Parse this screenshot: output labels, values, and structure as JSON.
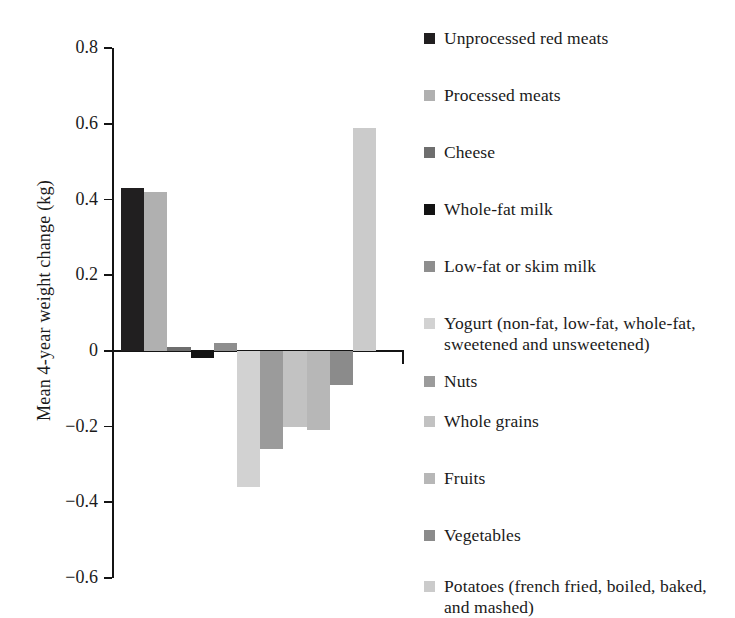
{
  "chart_data": {
    "type": "bar",
    "title": "",
    "subtitle": "",
    "xlabel": "",
    "ylabel": "Mean 4-year weight  change (kg)",
    "ylim": [
      -0.6,
      0.8
    ],
    "ytick_labels": [
      "0.8",
      "0.6",
      "0.4",
      "0.2",
      "0",
      "−0.2",
      "−0.4",
      "−0.6"
    ],
    "ytick_values": [
      0.8,
      0.6,
      0.4,
      0.2,
      0,
      -0.2,
      -0.4,
      -0.6
    ],
    "grid": false,
    "legend_position": "right",
    "categories": [
      "Unprocessed red meats",
      "Processed meats",
      "Cheese",
      "Whole-fat milk",
      "Low-fat or skim milk",
      "Yogurt (non-fat, low-fat, whole-fat, sweetened and unsweetened)",
      "Nuts",
      "Whole grains",
      "Fruits",
      "Vegetables",
      "Potatoes (french fried, boiled, baked, and mashed)"
    ],
    "values": [
      0.43,
      0.42,
      0.01,
      -0.02,
      0.02,
      -0.36,
      -0.26,
      -0.2,
      -0.21,
      -0.09,
      0.59
    ],
    "colors": [
      "#211f20",
      "#b0b0b0",
      "#6e6e6e",
      "#131313",
      "#8e8e8e",
      "#d2d2d2",
      "#9b9b9b",
      "#c2c2c2",
      "#b7b7b7",
      "#8b8b8b",
      "#cbcbcb"
    ]
  },
  "legend": {
    "items": [
      {
        "label": "Unprocessed red meats",
        "color": "#211f20",
        "swatch_name": "legend-swatch-unprocessed-red-meats"
      },
      {
        "label": "Processed meats",
        "color": "#b0b0b0",
        "swatch_name": "legend-swatch-processed-meats"
      },
      {
        "label": "Cheese",
        "color": "#6e6e6e",
        "swatch_name": "legend-swatch-cheese"
      },
      {
        "label": "Whole-fat milk",
        "color": "#131313",
        "swatch_name": "legend-swatch-whole-fat-milk"
      },
      {
        "label": "Low-fat or skim milk",
        "color": "#8e8e8e",
        "swatch_name": "legend-swatch-low-fat-or-skim-milk"
      },
      {
        "label": "Yogurt (non-fat, low-fat, whole-fat, sweetened and unsweetened)",
        "color": "#d2d2d2",
        "swatch_name": "legend-swatch-yogurt"
      },
      {
        "label": "Nuts",
        "color": "#9b9b9b",
        "swatch_name": "legend-swatch-nuts"
      },
      {
        "label": "Whole grains",
        "color": "#c2c2c2",
        "swatch_name": "legend-swatch-whole-grains"
      },
      {
        "label": "Fruits",
        "color": "#b7b7b7",
        "swatch_name": "legend-swatch-fruits"
      },
      {
        "label": "Vegetables",
        "color": "#8b8b8b",
        "swatch_name": "legend-swatch-vegetables"
      },
      {
        "label": "Potatoes (french fried, boiled, baked, and mashed)",
        "color": "#cbcbcb",
        "swatch_name": "legend-swatch-potatoes"
      }
    ]
  },
  "axis": {
    "ylabel": "Mean 4-year weight  change (kg)",
    "ticks": [
      "0.8",
      "0.6",
      "0.4",
      "0.2",
      "0",
      "−0.2",
      "−0.4",
      "−0.6"
    ]
  }
}
